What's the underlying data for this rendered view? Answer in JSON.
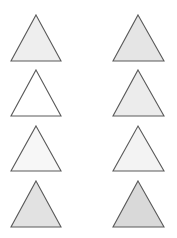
{
  "figure": {
    "background": "#ffffff",
    "stroke_color": "#5a5a5a",
    "stroke_width": 1.1,
    "triangles": [
      {
        "id": "left-1",
        "column": "left",
        "row": 1,
        "apex": [
          36,
          15
        ],
        "base_left": [
          11,
          61
        ],
        "base_right": [
          61,
          61
        ],
        "fill": "#eeeeee"
      },
      {
        "id": "left-2",
        "column": "left",
        "row": 2,
        "apex": [
          36,
          70
        ],
        "base_left": [
          11,
          116
        ],
        "base_right": [
          61,
          116
        ],
        "fill": "#ffffff"
      },
      {
        "id": "left-3",
        "column": "left",
        "row": 3,
        "apex": [
          36,
          126
        ],
        "base_left": [
          11,
          171
        ],
        "base_right": [
          61,
          171
        ],
        "fill": "#f7f7f7"
      },
      {
        "id": "left-4",
        "column": "left",
        "row": 4,
        "apex": [
          36,
          181
        ],
        "base_left": [
          11,
          227
        ],
        "base_right": [
          61,
          227
        ],
        "fill": "#e2e2e2"
      },
      {
        "id": "right-1",
        "column": "right",
        "row": 1,
        "apex": [
          138,
          15
        ],
        "base_left": [
          113,
          61
        ],
        "base_right": [
          164,
          61
        ],
        "fill": "#e5e5e5"
      },
      {
        "id": "right-2",
        "column": "right",
        "row": 2,
        "apex": [
          138,
          70
        ],
        "base_left": [
          113,
          116
        ],
        "base_right": [
          164,
          116
        ],
        "fill": "#ececec"
      },
      {
        "id": "right-3",
        "column": "right",
        "row": 3,
        "apex": [
          138,
          126
        ],
        "base_left": [
          113,
          171
        ],
        "base_right": [
          164,
          171
        ],
        "fill": "#f3f3f3"
      },
      {
        "id": "right-4",
        "column": "right",
        "row": 4,
        "apex": [
          138,
          181
        ],
        "base_left": [
          113,
          227
        ],
        "base_right": [
          164,
          227
        ],
        "fill": "#d9d9d9"
      }
    ]
  }
}
